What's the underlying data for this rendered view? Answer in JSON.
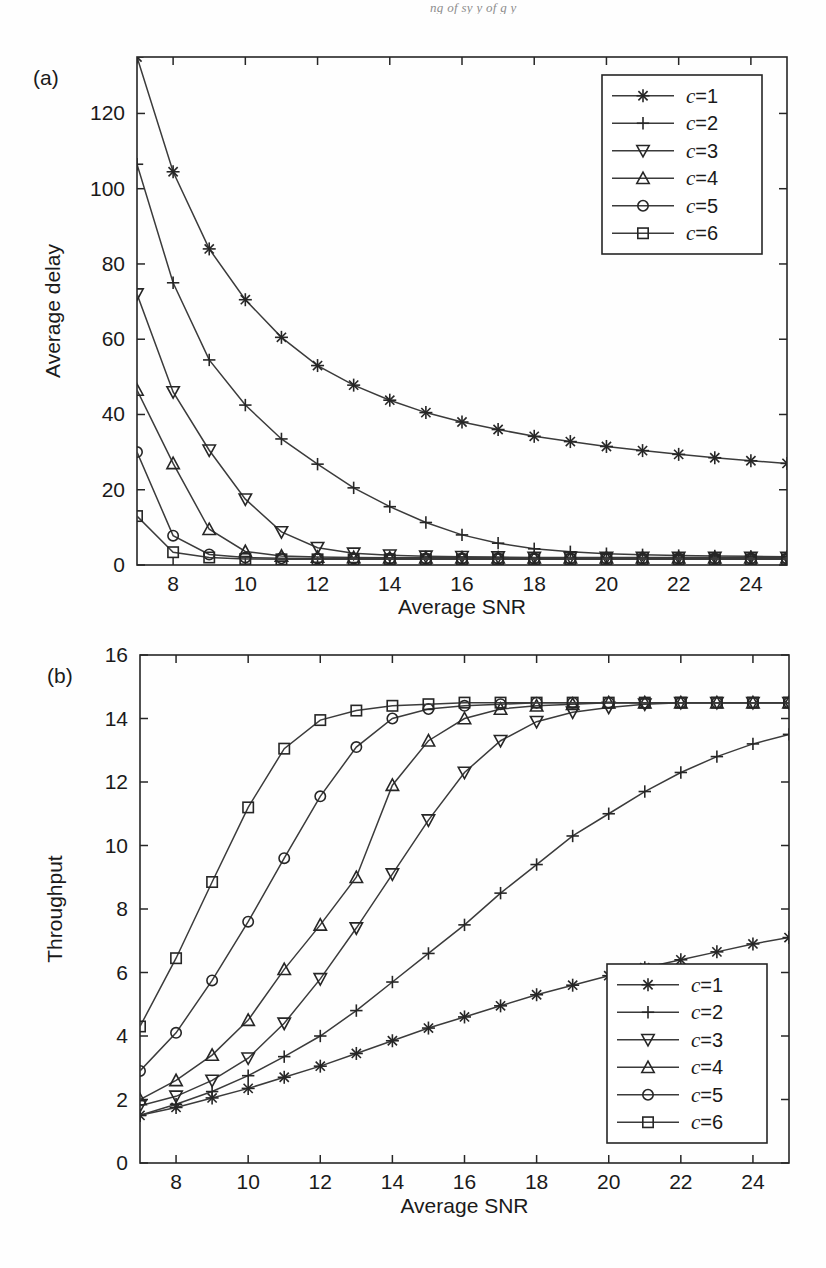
{
  "page": {
    "header_remnant": "ng  of  sy              y  of  g           y"
  },
  "figure": {
    "panels": [
      {
        "panel_label": "(a)",
        "xlabel": "Average SNR",
        "ylabel": "Average delay",
        "legend_position": "top-right",
        "legend_entries": [
          "c=1",
          "c=2",
          "c=3",
          "c=4",
          "c=5",
          "c=6"
        ]
      },
      {
        "panel_label": "(b)",
        "xlabel": "Average SNR",
        "ylabel": "Throughput",
        "legend_position": "bottom-right",
        "legend_entries": [
          "c=1",
          "c=2",
          "c=3",
          "c=4",
          "c=5",
          "c=6"
        ]
      }
    ]
  },
  "chart_data": [
    {
      "type": "line",
      "title": "",
      "panel": "(a)",
      "xlabel": "Average SNR",
      "ylabel": "Average delay",
      "x": [
        7,
        8,
        9,
        10,
        11,
        12,
        13,
        14,
        15,
        16,
        17,
        18,
        19,
        20,
        21,
        22,
        23,
        24,
        25
      ],
      "xlim": [
        7,
        25
      ],
      "ylim": [
        0,
        135
      ],
      "xticks": [
        8,
        10,
        12,
        14,
        16,
        18,
        20,
        22,
        24
      ],
      "yticks": [
        0,
        20,
        40,
        60,
        80,
        100,
        120
      ],
      "grid": false,
      "legend_position": "top-right",
      "series": [
        {
          "name": "c=1",
          "marker": "asterisk",
          "values": [
            135.0,
            104.5,
            84.0,
            70.5,
            60.5,
            53.0,
            47.8,
            43.8,
            40.5,
            38.0,
            36.0,
            34.2,
            32.8,
            31.5,
            30.4,
            29.4,
            28.5,
            27.7,
            27.0
          ]
        },
        {
          "name": "c=2",
          "marker": "plus",
          "values": [
            106.5,
            75.0,
            54.5,
            42.5,
            33.5,
            26.8,
            20.5,
            15.5,
            11.3,
            8.0,
            5.8,
            4.3,
            3.5,
            3.0,
            2.7,
            2.5,
            2.4,
            2.3,
            2.2
          ]
        },
        {
          "name": "c=3",
          "marker": "triangle-down",
          "values": [
            72.0,
            46.0,
            30.5,
            17.5,
            8.8,
            4.6,
            3.1,
            2.6,
            2.3,
            2.2,
            2.1,
            2.0,
            2.0,
            2.0,
            2.0,
            2.0,
            2.0,
            2.0,
            2.0
          ]
        },
        {
          "name": "c=4",
          "marker": "triangle-up",
          "values": [
            46.5,
            27.0,
            9.5,
            3.6,
            2.4,
            2.1,
            2.0,
            1.9,
            1.9,
            1.9,
            1.9,
            1.9,
            1.9,
            1.9,
            1.9,
            1.9,
            1.9,
            1.9,
            1.9
          ]
        },
        {
          "name": "c=5",
          "marker": "circle",
          "values": [
            30.0,
            7.8,
            2.8,
            2.0,
            1.8,
            1.7,
            1.7,
            1.7,
            1.7,
            1.7,
            1.7,
            1.7,
            1.7,
            1.7,
            1.7,
            1.7,
            1.7,
            1.7,
            1.7
          ]
        },
        {
          "name": "c=6",
          "marker": "square",
          "values": [
            13.0,
            3.4,
            2.0,
            1.6,
            1.5,
            1.5,
            1.5,
            1.5,
            1.5,
            1.5,
            1.5,
            1.5,
            1.5,
            1.5,
            1.5,
            1.5,
            1.5,
            1.5,
            1.5
          ]
        }
      ]
    },
    {
      "type": "line",
      "title": "",
      "panel": "(b)",
      "xlabel": "Average SNR",
      "ylabel": "Throughput",
      "x": [
        7,
        8,
        9,
        10,
        11,
        12,
        13,
        14,
        15,
        16,
        17,
        18,
        19,
        20,
        21,
        22,
        23,
        24,
        25
      ],
      "xlim": [
        7,
        25
      ],
      "ylim": [
        0,
        16
      ],
      "xticks": [
        8,
        10,
        12,
        14,
        16,
        18,
        20,
        22,
        24
      ],
      "yticks": [
        0,
        2,
        4,
        6,
        8,
        10,
        12,
        14,
        16
      ],
      "grid": false,
      "legend_position": "bottom-right",
      "series": [
        {
          "name": "c=1",
          "marker": "asterisk",
          "values": [
            1.5,
            1.75,
            2.05,
            2.35,
            2.7,
            3.05,
            3.45,
            3.85,
            4.25,
            4.6,
            4.95,
            5.3,
            5.6,
            5.9,
            6.15,
            6.4,
            6.65,
            6.9,
            7.1
          ]
        },
        {
          "name": "c=2",
          "marker": "plus",
          "values": [
            1.5,
            1.85,
            2.25,
            2.75,
            3.35,
            4.0,
            4.8,
            5.7,
            6.6,
            7.5,
            8.5,
            9.4,
            10.3,
            11.0,
            11.7,
            12.3,
            12.8,
            13.2,
            13.5
          ]
        },
        {
          "name": "c=3",
          "marker": "triangle-down",
          "values": [
            1.8,
            2.1,
            2.6,
            3.3,
            4.4,
            5.8,
            7.4,
            9.1,
            10.8,
            12.3,
            13.3,
            13.9,
            14.2,
            14.35,
            14.45,
            14.5,
            14.5,
            14.5,
            14.5
          ]
        },
        {
          "name": "c=4",
          "marker": "triangle-up",
          "values": [
            2.0,
            2.6,
            3.4,
            4.5,
            6.1,
            7.5,
            9.0,
            11.9,
            13.3,
            14.0,
            14.3,
            14.4,
            14.45,
            14.5,
            14.5,
            14.5,
            14.5,
            14.5,
            14.5
          ]
        },
        {
          "name": "c=5",
          "marker": "circle",
          "values": [
            2.9,
            4.1,
            5.75,
            7.6,
            9.6,
            11.55,
            13.1,
            14.0,
            14.3,
            14.4,
            14.45,
            14.5,
            14.5,
            14.5,
            14.5,
            14.5,
            14.5,
            14.5,
            14.5
          ]
        },
        {
          "name": "c=6",
          "marker": "square",
          "values": [
            4.3,
            6.45,
            8.85,
            11.2,
            13.05,
            13.95,
            14.25,
            14.4,
            14.45,
            14.5,
            14.5,
            14.5,
            14.5,
            14.5,
            14.5,
            14.5,
            14.5,
            14.5,
            14.5
          ]
        }
      ]
    }
  ]
}
